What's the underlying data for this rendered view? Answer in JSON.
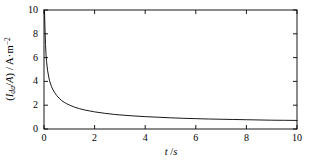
{
  "chart_data": {
    "type": "line",
    "title": "",
    "subtitle": "",
    "xlabel": "t /s",
    "xlabel_parts": {
      "symbol": "t",
      "unit": "/s"
    },
    "ylabel": "(I_da/A) / A·m⁻²",
    "ylabel_parts": {
      "open": "(",
      "symbol": "I",
      "subscript": "da",
      "divider": "/",
      "area_symbol": "A",
      "close": ")",
      "slash": " / ",
      "unit_base": "A·m",
      "unit_exponent": "−2"
    },
    "xlim": [
      0,
      10
    ],
    "ylim": [
      0,
      10
    ],
    "xticks": [
      0,
      2,
      4,
      6,
      8,
      10
    ],
    "yticks": [
      0,
      2,
      4,
      6,
      8,
      10
    ],
    "xtick_labels": [
      "0",
      "2",
      "4",
      "6",
      "8",
      "10"
    ],
    "ytick_labels": [
      "0",
      "2",
      "4",
      "6",
      "8",
      "10"
    ],
    "grid": false,
    "legend": null,
    "legend_position": "none",
    "frame": "box",
    "tick_direction": "in",
    "line_color": "#000000",
    "line_width": 0.9,
    "background_color": "#ffffff",
    "axis_color": "#000000",
    "series": [
      {
        "name": "current density decay",
        "x": [
          0.0,
          0.02,
          0.04,
          0.06,
          0.08,
          0.1,
          0.14,
          0.18,
          0.22,
          0.26,
          0.3,
          0.36,
          0.42,
          0.5,
          0.6,
          0.7,
          0.8,
          0.9,
          1.0,
          1.2,
          1.4,
          1.6,
          1.8,
          2.0,
          2.4,
          2.8,
          3.2,
          3.6,
          4.0,
          4.5,
          5.0,
          5.5,
          6.0,
          6.5,
          7.0,
          7.5,
          8.0,
          8.5,
          9.0,
          9.5,
          10.0
        ],
        "y": [
          10.0,
          9.95,
          8.4,
          7.1,
          6.25,
          5.7,
          4.95,
          4.45,
          4.05,
          3.78,
          3.55,
          3.28,
          3.06,
          2.82,
          2.58,
          2.39,
          2.24,
          2.12,
          2.02,
          1.84,
          1.71,
          1.6,
          1.52,
          1.44,
          1.32,
          1.22,
          1.15,
          1.09,
          1.04,
          0.99,
          0.94,
          0.9,
          0.87,
          0.84,
          0.82,
          0.8,
          0.78,
          0.76,
          0.74,
          0.73,
          0.72
        ]
      }
    ]
  }
}
